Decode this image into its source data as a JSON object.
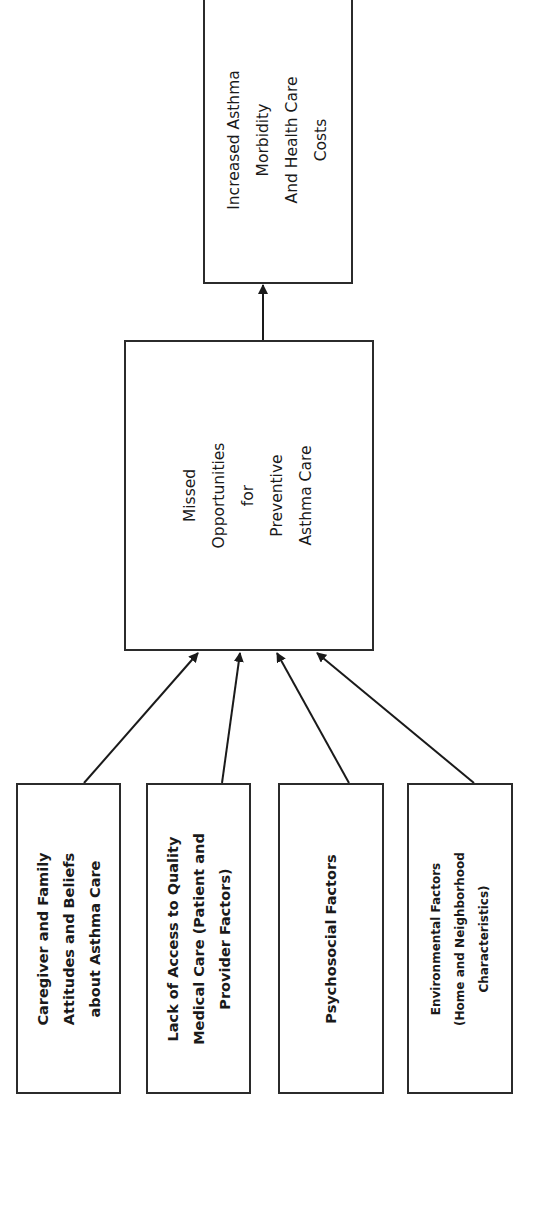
{
  "diagram": {
    "title": "",
    "orientation": "rotated-90-ccw",
    "outcome": {
      "lines": [
        "Increased Asthma",
        "Morbidity",
        "And Health Care",
        "Costs"
      ]
    },
    "mediator": {
      "lines": [
        "Missed",
        "Opportunities",
        "for",
        "Preventive",
        "Asthma Care"
      ]
    },
    "factors": [
      {
        "lines": [
          "Caregiver and Family",
          "Attitudes and Beliefs",
          "about Asthma Care"
        ]
      },
      {
        "lines": [
          "Lack of Access to Quality",
          "Medical Care (Patient and",
          "Provider Factors)"
        ]
      },
      {
        "lines": [
          "Psychosocial Factors"
        ]
      },
      {
        "lines": [
          "Environmental Factors",
          "(Home and Neighborhood",
          "Characteristics)"
        ]
      }
    ],
    "edges": [
      {
        "from": "factors.0",
        "to": "mediator"
      },
      {
        "from": "factors.1",
        "to": "mediator"
      },
      {
        "from": "factors.2",
        "to": "mediator"
      },
      {
        "from": "factors.3",
        "to": "mediator"
      },
      {
        "from": "mediator",
        "to": "outcome"
      }
    ],
    "colors": {
      "stroke": "#2b2b2b",
      "text": "#1a1a1a",
      "background": "#ffffff"
    }
  }
}
